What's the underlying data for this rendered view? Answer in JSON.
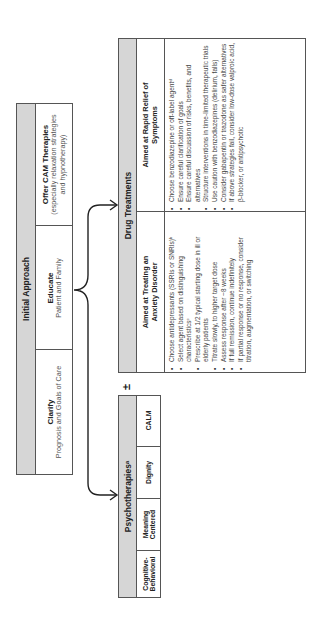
{
  "initial_approach": {
    "title": "Initial Approach",
    "items": [
      {
        "title": "Clarify",
        "subtitle": "Prognosis and Goals of Care"
      },
      {
        "title": "Educate",
        "subtitle": "Patient and Family"
      },
      {
        "title": "Offer CAM Therapies",
        "subtitle": "(especially relaxation strategies and hypnotherapy)"
      }
    ]
  },
  "plus_minus": "±",
  "psychotherapies": {
    "title": "Psychotherapiesᵃ",
    "items": [
      "Cognitive-Behavioral",
      "Meaning Centered",
      "Dignity",
      "CALM"
    ]
  },
  "drug_treatments": {
    "title": "Drug Treatments",
    "columns": [
      {
        "header": "Aimed at Treating an Anxiety Disorder",
        "bullets": [
          "Choose antidepressants (SSRIs or SNRIs)ᵇ",
          "Select agent based on distinguishing characteristicsᶜ",
          "Prescribe at 1/2 typical starting dose in ill or elderly patients",
          "Titrate slowly, to higher target dose",
          "Assess response after ~8 weeks",
          "If full remission, continue indefinitely",
          "If partial response or no response, consider titration, augmentation, or switching"
        ]
      },
      {
        "header": "Aimed at Rapid Relief of Symptoms",
        "bullets": [
          "Choose benzodiazepine or off-label agentᵈ",
          "Ensure careful clarification of goals",
          "Ensure careful discussion of risks, benefits, and alternatives",
          "Structure interventions in time-limited therapeutic trials",
          "Use caution with benzodiazepines (delirium, falls)",
          "Consider gabapentin or trazodone as safer alternatives",
          "If above strategies fail, consider low-dose valproic acid, β-blocker, or antipsychotic"
        ]
      }
    ]
  },
  "colors": {
    "header_gray": "#d6d6d6",
    "border": "#555555",
    "text": "#222222"
  }
}
